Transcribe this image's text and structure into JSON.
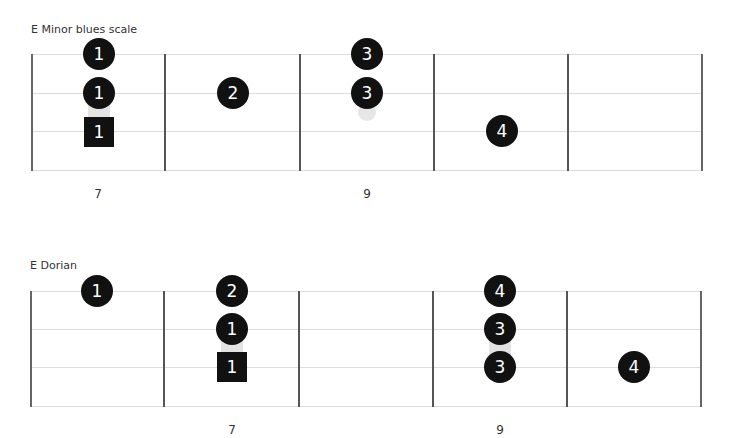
{
  "diagrams": [
    {
      "title": "E Minor blues scale",
      "fret_numbers": [
        {
          "label": "7",
          "x": 98
        },
        {
          "label": "9",
          "x": 367
        }
      ],
      "notes": [
        {
          "finger": "1",
          "x": 99,
          "y": 54,
          "shape": "circle"
        },
        {
          "finger": "1",
          "x": 99,
          "y": 93,
          "shape": "circle"
        },
        {
          "finger": "1",
          "x": 99,
          "y": 132,
          "shape": "square",
          "role": "root"
        },
        {
          "finger": "2",
          "x": 233,
          "y": 93,
          "shape": "circle"
        },
        {
          "finger": "3",
          "x": 367,
          "y": 54,
          "shape": "circle"
        },
        {
          "finger": "3",
          "x": 367,
          "y": 93,
          "shape": "circle"
        },
        {
          "finger": "4",
          "x": 502,
          "y": 131,
          "shape": "circle"
        }
      ]
    },
    {
      "title": "E Dorian",
      "fret_numbers": [
        {
          "label": "7",
          "x": 232
        },
        {
          "label": "9",
          "x": 500
        }
      ],
      "notes": [
        {
          "finger": "1",
          "x": 97,
          "y": 291,
          "shape": "circle"
        },
        {
          "finger": "2",
          "x": 232,
          "y": 291,
          "shape": "circle"
        },
        {
          "finger": "1",
          "x": 232,
          "y": 329,
          "shape": "circle"
        },
        {
          "finger": "1",
          "x": 232,
          "y": 367,
          "shape": "square",
          "role": "root"
        },
        {
          "finger": "4",
          "x": 500,
          "y": 291,
          "shape": "circle"
        },
        {
          "finger": "3",
          "x": 500,
          "y": 329,
          "shape": "circle"
        },
        {
          "finger": "3",
          "x": 500,
          "y": 367,
          "shape": "circle"
        },
        {
          "finger": "4",
          "x": 634,
          "y": 367,
          "shape": "circle"
        }
      ]
    }
  ],
  "colors": {
    "note_fill": "#111111",
    "note_text": "#ffffff",
    "string_line": "#dcdcdc",
    "fret_line": "#555555",
    "ghost": "#e6e6e6"
  }
}
